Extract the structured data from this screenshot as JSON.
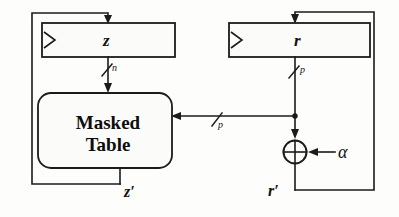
{
  "diagram": {
    "registers": [
      {
        "id": "z-register",
        "label": "z",
        "clock_marker": "clock-triangle"
      },
      {
        "id": "r-register",
        "label": "r",
        "clock_marker": "clock-triangle"
      }
    ],
    "blocks": [
      {
        "id": "masked-table",
        "line1": "Masked",
        "line2": "Table"
      }
    ],
    "gates": [
      {
        "id": "xor-gate",
        "symbol": "⊕",
        "input_label": "α"
      }
    ],
    "bus_widths": [
      {
        "id": "z-bus-width",
        "label": "n"
      },
      {
        "id": "r-bus-width",
        "label": "p"
      },
      {
        "id": "mask-bus-width",
        "label": "p"
      }
    ],
    "signals": [
      {
        "id": "z-prime",
        "label": "z′"
      },
      {
        "id": "r-prime",
        "label": "r′"
      }
    ],
    "colors": {
      "ink": "#1b1b1b",
      "paper": "#fdfdfc",
      "box_fill": "#fbfbfa"
    }
  }
}
